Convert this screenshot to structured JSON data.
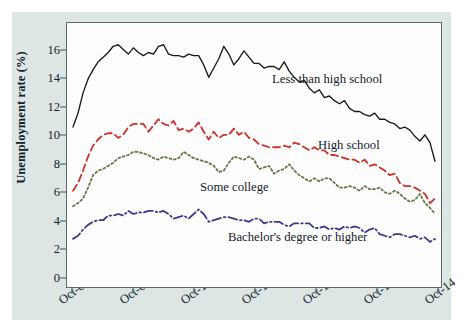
{
  "figure": {
    "background_color": "#dde6e4",
    "plot_background_color": "#fdfdfd",
    "frame_color": "#5c6b6a"
  },
  "chart_data": {
    "type": "line",
    "title": "",
    "xlabel": "",
    "ylabel": "Unemployment rate (%)",
    "ylim": [
      0,
      17
    ],
    "yticks": [
      0,
      2,
      4,
      6,
      8,
      10,
      12,
      14,
      16
    ],
    "ytick_labels": [
      "0",
      "2",
      "4",
      "6",
      "8",
      "10",
      "12",
      "14",
      "16"
    ],
    "xticks": [
      "Oct-08",
      "Oct-09",
      "Oct-10",
      "Oct-11",
      "Oct-12",
      "Oct-13",
      "Oct-14"
    ],
    "xtick_labels": [
      "Oct-08",
      "Oct-09",
      "Oct-10",
      "Oct-11",
      "Oct-12",
      "Oct-13",
      "Oct-14"
    ],
    "xlim": [
      "Oct-08",
      "Oct-14"
    ],
    "grid": false,
    "legend_position": "inline-annotations",
    "x": [
      "Oct-08",
      "Nov-08",
      "Dec-08",
      "Jan-09",
      "Feb-09",
      "Mar-09",
      "Apr-09",
      "May-09",
      "Jun-09",
      "Jul-09",
      "Aug-09",
      "Sep-09",
      "Oct-09",
      "Nov-09",
      "Dec-09",
      "Jan-10",
      "Feb-10",
      "Mar-10",
      "Apr-10",
      "May-10",
      "Jun-10",
      "Jul-10",
      "Aug-10",
      "Sep-10",
      "Oct-10",
      "Nov-10",
      "Dec-10",
      "Jan-11",
      "Feb-11",
      "Mar-11",
      "Apr-11",
      "May-11",
      "Jun-11",
      "Jul-11",
      "Aug-11",
      "Sep-11",
      "Oct-11",
      "Nov-11",
      "Dec-11",
      "Jan-12",
      "Feb-12",
      "Mar-12",
      "Apr-12",
      "May-12",
      "Jun-12",
      "Jul-12",
      "Aug-12",
      "Sep-12",
      "Oct-12",
      "Nov-12",
      "Dec-12",
      "Jan-13",
      "Feb-13",
      "Mar-13",
      "Apr-13",
      "May-13",
      "Jun-13",
      "Jul-13",
      "Aug-13",
      "Sep-13",
      "Oct-13",
      "Nov-13",
      "Dec-13",
      "Jan-14",
      "Feb-14",
      "Mar-14",
      "Apr-14",
      "May-14",
      "Jun-14",
      "Jul-14",
      "Aug-14",
      "Sep-14",
      "Oct-14"
    ],
    "series": [
      {
        "name": "Less than high school",
        "color": "#1a1a1a",
        "line_style": "solid",
        "annotation": "Less than high school",
        "values": [
          10.3,
          11.2,
          12.5,
          13.4,
          14.0,
          14.5,
          14.8,
          15.1,
          15.5,
          15.6,
          15.3,
          15.0,
          15.4,
          15.1,
          14.9,
          15.1,
          15.0,
          15.5,
          15.6,
          15.0,
          14.9,
          14.9,
          14.8,
          15.0,
          14.9,
          14.9,
          14.3,
          13.5,
          14.1,
          14.7,
          15.5,
          15.0,
          14.3,
          14.7,
          15.2,
          14.8,
          14.4,
          14.4,
          14.1,
          14.2,
          14.2,
          14.0,
          14.5,
          13.9,
          13.5,
          13.2,
          13.3,
          12.8,
          12.5,
          12.7,
          12.2,
          12.3,
          12.0,
          11.8,
          12.0,
          11.5,
          11.3,
          11.3,
          11.1,
          11.0,
          11.2,
          10.8,
          10.8,
          10.6,
          10.5,
          10.2,
          10.3,
          10.1,
          9.7,
          9.4,
          9.8,
          9.3,
          8.1
        ]
      },
      {
        "name": "High school",
        "color": "#cf302a",
        "line_style": "dashed",
        "annotation": "High school",
        "values": [
          6.2,
          6.7,
          7.5,
          8.4,
          9.1,
          9.5,
          9.8,
          9.9,
          9.9,
          9.6,
          9.8,
          10.3,
          10.5,
          10.5,
          10.5,
          10.0,
          10.4,
          10.8,
          10.5,
          10.4,
          10.7,
          10.1,
          10.2,
          10.0,
          10.2,
          10.6,
          10.0,
          9.5,
          10.0,
          9.6,
          9.8,
          9.8,
          10.2,
          9.8,
          10.0,
          9.6,
          9.5,
          9.2,
          9.1,
          9.0,
          9.0,
          9.0,
          9.1,
          9.0,
          9.3,
          9.2,
          9.0,
          8.8,
          9.0,
          8.8,
          8.8,
          8.5,
          8.5,
          8.4,
          8.3,
          8.2,
          8.2,
          8.0,
          8.2,
          7.8,
          7.9,
          7.7,
          7.5,
          7.2,
          7.3,
          6.7,
          6.5,
          6.5,
          6.4,
          6.2,
          6.0,
          5.4,
          5.7
        ]
      },
      {
        "name": "Some college",
        "color": "#5e7a42",
        "line_style": "dotted",
        "annotation": "Some college",
        "values": [
          5.2,
          5.4,
          5.7,
          6.4,
          7.2,
          7.5,
          7.6,
          7.8,
          8.0,
          8.3,
          8.4,
          8.5,
          8.7,
          8.7,
          8.6,
          8.5,
          8.3,
          8.2,
          8.4,
          8.3,
          8.2,
          8.3,
          8.7,
          8.5,
          8.3,
          8.2,
          8.1,
          8.0,
          7.8,
          7.4,
          7.5,
          8.0,
          8.4,
          8.3,
          8.2,
          8.4,
          8.2,
          7.6,
          7.7,
          7.8,
          7.3,
          7.5,
          7.6,
          7.9,
          7.5,
          7.2,
          7.0,
          6.8,
          7.0,
          6.8,
          7.0,
          7.0,
          6.7,
          6.4,
          6.4,
          6.5,
          6.4,
          6.2,
          6.5,
          6.3,
          6.3,
          6.4,
          6.1,
          6.0,
          6.2,
          6.0,
          5.7,
          5.5,
          5.6,
          6.0,
          5.4,
          5.1,
          4.7
        ]
      },
      {
        "name": "Bachelor's degree or higher",
        "color": "#3a3a8c",
        "line_style": "dashdot",
        "annotation": "Bachelor's degree or higher",
        "values": [
          3.1,
          3.3,
          3.7,
          4.0,
          4.2,
          4.3,
          4.3,
          4.6,
          4.6,
          4.7,
          4.6,
          4.9,
          4.7,
          4.8,
          4.8,
          4.9,
          4.9,
          4.8,
          4.9,
          4.7,
          4.4,
          4.5,
          4.6,
          4.4,
          4.7,
          5.0,
          4.7,
          4.2,
          4.3,
          4.4,
          4.5,
          4.5,
          4.4,
          4.3,
          4.3,
          4.2,
          4.4,
          4.4,
          4.1,
          4.2,
          4.2,
          4.2,
          4.0,
          3.9,
          4.1,
          4.1,
          4.1,
          4.1,
          3.8,
          3.8,
          3.9,
          3.7,
          3.8,
          3.7,
          3.9,
          3.8,
          3.9,
          3.8,
          3.5,
          3.7,
          3.8,
          3.4,
          3.3,
          3.2,
          3.4,
          3.4,
          3.3,
          3.2,
          3.3,
          3.1,
          3.2,
          2.9,
          3.1
        ]
      }
    ]
  },
  "annotations": {
    "less_than_high_school": "Less than high school",
    "high_school": "High school",
    "some_college": "Some college",
    "bachelors": "Bachelor's degree or higher"
  },
  "bleed_text": {
    "line1": "of the current labor market",
    "line2": "employment rates across",
    "line3": "wage growth remained weak"
  }
}
